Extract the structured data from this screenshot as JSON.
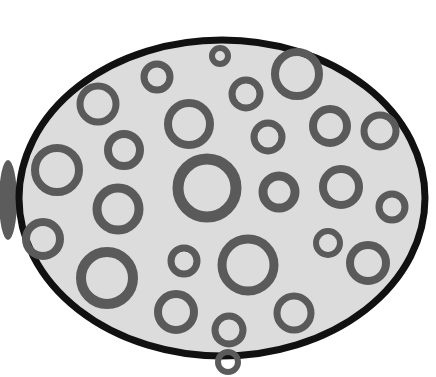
{
  "image": {
    "description": "Hand-drawn oval dish filled with gray rings",
    "width": 436,
    "height": 377
  },
  "colors": {
    "background": "#ffffff",
    "dish_fill": "#dcdcdc",
    "dish_outline": "#111111",
    "ring": "#5a5a5a",
    "shadow": "#333333"
  },
  "dish": {
    "cx": 222,
    "cy": 198,
    "rx": 203,
    "ry": 158,
    "stroke": 7
  },
  "rings": [
    {
      "cx": 98,
      "cy": 104,
      "r": 18,
      "w": 7
    },
    {
      "cx": 157,
      "cy": 77,
      "r": 13,
      "w": 7
    },
    {
      "cx": 220,
      "cy": 56,
      "r": 8,
      "w": 6
    },
    {
      "cx": 297,
      "cy": 74,
      "r": 22,
      "w": 8
    },
    {
      "cx": 246,
      "cy": 94,
      "r": 14,
      "w": 7
    },
    {
      "cx": 189,
      "cy": 124,
      "r": 21,
      "w": 8
    },
    {
      "cx": 124,
      "cy": 150,
      "r": 16,
      "w": 8
    },
    {
      "cx": 57,
      "cy": 170,
      "r": 22,
      "w": 8
    },
    {
      "cx": 268,
      "cy": 137,
      "r": 14,
      "w": 7
    },
    {
      "cx": 330,
      "cy": 126,
      "r": 17,
      "w": 8
    },
    {
      "cx": 380,
      "cy": 131,
      "r": 16,
      "w": 7
    },
    {
      "cx": 207,
      "cy": 188,
      "r": 29,
      "w": 11
    },
    {
      "cx": 279,
      "cy": 192,
      "r": 16,
      "w": 9
    },
    {
      "cx": 341,
      "cy": 187,
      "r": 18,
      "w": 8
    },
    {
      "cx": 392,
      "cy": 207,
      "r": 13,
      "w": 7
    },
    {
      "cx": 118,
      "cy": 209,
      "r": 21,
      "w": 9
    },
    {
      "cx": 43,
      "cy": 239,
      "r": 17,
      "w": 8
    },
    {
      "cx": 328,
      "cy": 243,
      "r": 12,
      "w": 6
    },
    {
      "cx": 184,
      "cy": 261,
      "r": 13,
      "w": 7
    },
    {
      "cx": 248,
      "cy": 265,
      "r": 26,
      "w": 9
    },
    {
      "cx": 368,
      "cy": 263,
      "r": 18,
      "w": 8
    },
    {
      "cx": 107,
      "cy": 278,
      "r": 26,
      "w": 10
    },
    {
      "cx": 176,
      "cy": 312,
      "r": 18,
      "w": 8
    },
    {
      "cx": 294,
      "cy": 313,
      "r": 17,
      "w": 7
    },
    {
      "cx": 229,
      "cy": 330,
      "r": 14,
      "w": 7
    },
    {
      "cx": 228,
      "cy": 362,
      "r": 10,
      "w": 6
    }
  ]
}
